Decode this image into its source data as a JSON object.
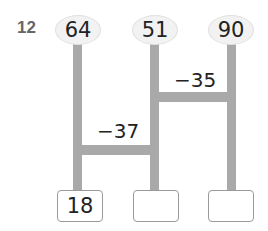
{
  "problem": {
    "number": "12",
    "top_values": [
      "64",
      "51",
      "90"
    ],
    "operations": [
      {
        "label": "−35",
        "between": "51 and 90"
      },
      {
        "label": "−37",
        "between": "64 and 51"
      }
    ],
    "answers": [
      "18",
      "",
      ""
    ]
  },
  "colors": {
    "bar": "#a9a9a9",
    "oval_fill": "#f2f2f2",
    "box_border": "#9a9a9a"
  }
}
